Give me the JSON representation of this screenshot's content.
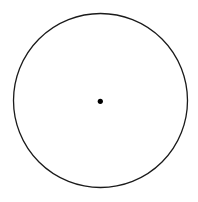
{
  "diagram": {
    "background": "#ffffff",
    "circle": {
      "cx": 100.5,
      "cy": 100.5,
      "r": 87,
      "stroke": "#1a1a1a",
      "stroke_width": 1.3,
      "fill": "none"
    },
    "center_point": {
      "cx": 100.3,
      "cy": 101.3,
      "r": 2.6,
      "fill": "#000000"
    }
  }
}
